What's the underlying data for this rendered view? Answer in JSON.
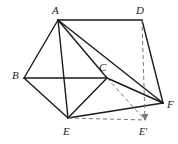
{
  "figure": {
    "name": "solid-geometry-diagram",
    "background_color": "#ffffff",
    "stroke_color": "#1a1a1a",
    "dashed_stroke_color": "#777777",
    "width": 178,
    "height": 144
  },
  "vertices": [
    {
      "id": "A",
      "label": "A",
      "x": 58,
      "y": 20,
      "label_x": 52,
      "label_y": 5
    },
    {
      "id": "D",
      "label": "D",
      "x": 142,
      "y": 20,
      "label_x": 136,
      "label_y": 5
    },
    {
      "id": "B",
      "label": "B",
      "x": 24,
      "y": 78,
      "label_x": 12,
      "label_y": 70
    },
    {
      "id": "C",
      "label": "C",
      "x": 107,
      "y": 78,
      "label_x": 99,
      "label_y": 62
    },
    {
      "id": "E",
      "label": "E",
      "x": 68,
      "y": 118,
      "label_x": 63,
      "label_y": 126
    },
    {
      "id": "F",
      "label": "F",
      "x": 163,
      "y": 103,
      "label_x": 167,
      "label_y": 99
    },
    {
      "id": "Ep",
      "label": "E'",
      "x": 145,
      "y": 120,
      "label_x": 139,
      "label_y": 126
    }
  ],
  "edges": [
    {
      "name": "edge-A-D",
      "from": "A",
      "to": "D",
      "style": "solid"
    },
    {
      "name": "edge-A-B",
      "from": "A",
      "to": "B",
      "style": "solid"
    },
    {
      "name": "edge-A-E",
      "from": "A",
      "to": "E",
      "style": "solid"
    },
    {
      "name": "edge-A-C",
      "from": "A",
      "to": "C",
      "style": "solid"
    },
    {
      "name": "edge-A-F",
      "from": "A",
      "to": "F",
      "style": "solid"
    },
    {
      "name": "edge-B-C",
      "from": "B",
      "to": "C",
      "style": "solid"
    },
    {
      "name": "edge-B-E",
      "from": "B",
      "to": "E",
      "style": "solid"
    },
    {
      "name": "edge-C-E",
      "from": "C",
      "to": "E",
      "style": "solid"
    },
    {
      "name": "edge-C-F",
      "from": "C",
      "to": "F",
      "style": "solid"
    },
    {
      "name": "edge-D-F",
      "from": "D",
      "to": "F",
      "style": "solid"
    },
    {
      "name": "edge-E-F",
      "from": "E",
      "to": "F",
      "style": "solid"
    },
    {
      "name": "edge-D-Eprime",
      "from": "D",
      "to": "Ep",
      "style": "dashed"
    },
    {
      "name": "edge-C-Eprime",
      "from": "C",
      "to": "Ep",
      "style": "dashed"
    },
    {
      "name": "edge-E-Eprime",
      "from": "E",
      "to": "Ep",
      "style": "dashed"
    }
  ],
  "arrows": [
    {
      "name": "arrowhead-at-Eprime",
      "at": "Ep"
    }
  ]
}
